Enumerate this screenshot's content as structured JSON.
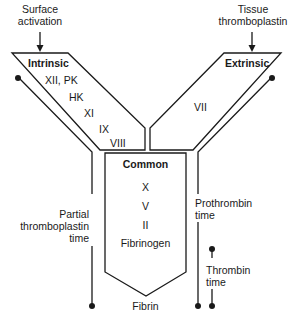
{
  "inputs": {
    "surface_activation": "Surface\nactivation",
    "surface_activation_line1": "Surface",
    "surface_activation_line2": "activation",
    "tissue_line1": "Tissue",
    "tissue_line2": "thromboplastin"
  },
  "pathways": {
    "intrinsic": {
      "title": "Intrinsic",
      "factors": [
        "XII, PK",
        "HK",
        "XI",
        "IX",
        "VIII"
      ]
    },
    "extrinsic": {
      "title": "Extrinsic",
      "factors": [
        "VII"
      ]
    },
    "common": {
      "title": "Common",
      "factors": [
        "X",
        "V",
        "II",
        "Fibrinogen"
      ]
    }
  },
  "output": "Fibrin",
  "tests": {
    "ptt": {
      "line1": "Partial",
      "line2": "thromboplastin",
      "line3": "time"
    },
    "pt": {
      "line1": "Prothrombin",
      "line2": "time"
    },
    "tt": {
      "line1": "Thrombin",
      "line2": "time"
    }
  },
  "colors": {
    "stroke": "#1a1a1a",
    "background": "#ffffff"
  }
}
